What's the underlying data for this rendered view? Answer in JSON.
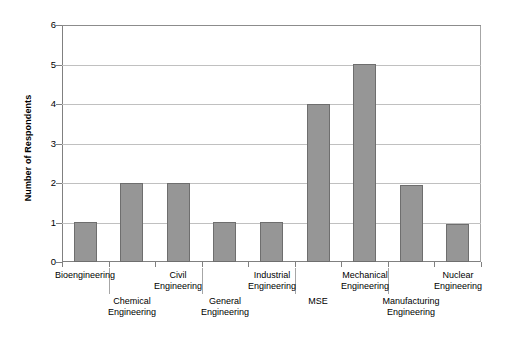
{
  "chart_data": {
    "type": "bar",
    "title": "",
    "xlabel": "",
    "ylabel": "Number of Respondents",
    "ylim": [
      0,
      6
    ],
    "ytick_labels": [
      "6",
      "5",
      "4",
      "3",
      "2",
      "1",
      "0"
    ],
    "ytick_values": [
      6,
      5,
      4,
      3,
      2,
      1,
      0
    ],
    "grid": true,
    "legend": false,
    "categories": [
      "Bioengineering",
      "Chemical Engineering",
      "Civil Engineering",
      "General Engineering",
      "Industrial Engineering",
      "MSE",
      "Mechanical Engineering",
      "Manufacturing Engineering",
      "Nuclear Engineering"
    ],
    "values": [
      1,
      2,
      2,
      1,
      1,
      4,
      5,
      1.95,
      0.95
    ],
    "bar_color": "#969696",
    "bar_border_color": "#6e6e6e",
    "gridline_color": "#c0c0c0",
    "axis_color": "#808080"
  },
  "axis": {
    "y_title": "Number of Respondents"
  },
  "category_labels": [
    {
      "lines": [
        "Bioengineering"
      ],
      "row": "top"
    },
    {
      "lines": [
        "Chemical",
        "Engineering"
      ],
      "row": "bottom"
    },
    {
      "lines": [
        "Civil",
        "Engineering"
      ],
      "row": "top"
    },
    {
      "lines": [
        "General",
        "Engineering"
      ],
      "row": "bottom"
    },
    {
      "lines": [
        "Industrial",
        "Engineering"
      ],
      "row": "top"
    },
    {
      "lines": [
        "MSE"
      ],
      "row": "bottom"
    },
    {
      "lines": [
        "Mechanical",
        "Engineering"
      ],
      "row": "top"
    },
    {
      "lines": [
        "Manufacturing",
        "Engineering"
      ],
      "row": "bottom"
    },
    {
      "lines": [
        "Nuclear",
        "Engineering"
      ],
      "row": "top"
    }
  ]
}
